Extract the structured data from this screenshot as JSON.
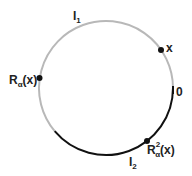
{
  "diagram": {
    "circle": {
      "cx": 106,
      "cy": 88,
      "r": 67
    },
    "colors": {
      "gray_arc": "#b8b8b8",
      "black_arc": "#111111",
      "points": "#111111"
    },
    "arcs": [
      {
        "name": "I1",
        "color": "gray",
        "label": "I",
        "subscript": "1"
      },
      {
        "name": "I2",
        "color": "black",
        "label": "I",
        "subscript": "2"
      }
    ],
    "points": [
      {
        "name": "x",
        "label": "x"
      },
      {
        "name": "R_alpha_x",
        "label_main": "R",
        "label_sub": "α",
        "label_rest": "(x)"
      },
      {
        "name": "R_alpha2_x",
        "label_main": "R",
        "label_sup": "2",
        "label_sub": "α",
        "label_rest": "(x)"
      }
    ],
    "zero_label": "0"
  }
}
